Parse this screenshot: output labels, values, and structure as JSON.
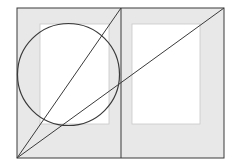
{
  "diagram": {
    "type": "page-layout-canon",
    "canvas": {
      "width": 236,
      "height": 167,
      "background": "#ffffff"
    },
    "spread": {
      "x": 17,
      "y": 8,
      "width": 207,
      "height": 150,
      "fill": "#e8e8e8",
      "stroke": "#3a3a3a"
    },
    "spine": {
      "x": 121,
      "y1": 8,
      "y2": 158,
      "stroke": "#3a3a3a"
    },
    "text_blocks": [
      {
        "name": "left-page-text-block",
        "x": 40,
        "y": 24,
        "width": 69,
        "height": 100,
        "fill": "#ffffff",
        "stroke": "#c8c8c8"
      },
      {
        "name": "right-page-text-block",
        "x": 132,
        "y": 24,
        "width": 68,
        "height": 100,
        "fill": "#ffffff",
        "stroke": "#c8c8c8"
      }
    ],
    "circle": {
      "cx": 68.5,
      "cy": 74.5,
      "r": 51,
      "stroke": "#3a3a3a"
    },
    "diagonals": [
      {
        "name": "single-page-diagonal",
        "x1": 17,
        "y1": 158,
        "x2": 121,
        "y2": 8
      },
      {
        "name": "spread-diagonal",
        "x1": 17,
        "y1": 158,
        "x2": 224,
        "y2": 8
      }
    ],
    "line_color": "#3a3a3a"
  }
}
